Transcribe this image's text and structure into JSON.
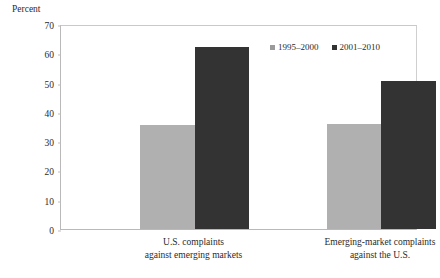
{
  "chart_data": {
    "type": "bar",
    "title": "",
    "ylabel": "Percent",
    "xlabel": "",
    "ylim": [
      0,
      70
    ],
    "ytick_step": 10,
    "ytick_labels": [
      "0",
      "10",
      "20",
      "30",
      "40",
      "50",
      "60",
      "70"
    ],
    "grid": false,
    "legend_position": "top-right-inside",
    "categories": [
      "U.S. complaints against emerging markets",
      "Emerging-market complaints against the U.S."
    ],
    "category_lines": [
      [
        "U.S. complaints",
        "against emerging markets"
      ],
      [
        "Emerging-market complaints",
        "against the U.S."
      ]
    ],
    "series": [
      {
        "name": "1995–2000",
        "color": "#b0b0b0",
        "values": [
          35.5,
          36.0
        ]
      },
      {
        "name": "2001–2010",
        "color": "#333333",
        "values": [
          62.0,
          50.5
        ]
      }
    ]
  },
  "colors": {
    "series_1995_2000": "#b0b0b0",
    "series_2001_2010": "#333333",
    "legend_swatch_1995_2000": "#9a9a9a",
    "axis_line": "#b9b9b9",
    "text": "#2b2b2b",
    "background": "#ffffff"
  }
}
